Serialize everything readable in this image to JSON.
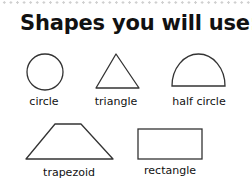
{
  "title": "Shapes you will use:",
  "shapes": [
    {
      "name": "circle",
      "label": "circle"
    },
    {
      "name": "triangle",
      "label": "triangle"
    },
    {
      "name": "half-circle",
      "label": "half circle"
    },
    {
      "name": "trapezoid",
      "label": "trapezoid"
    },
    {
      "name": "rectangle",
      "label": "rectangle"
    }
  ],
  "colors": {
    "stroke": "#333333",
    "dots": "#cfcfcf",
    "text": "#111111"
  }
}
